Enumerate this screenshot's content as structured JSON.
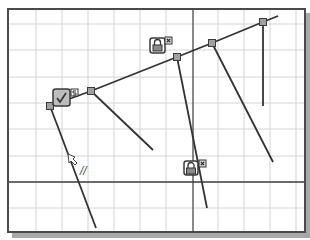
{
  "canvas": {
    "background": "#ffffff",
    "frame": {
      "x": 8,
      "y": 9,
      "w": 297,
      "h": 223,
      "color": "#4a4a4a",
      "shadow_color": "#a8a8a8"
    },
    "grid": {
      "color": "#d4d4d4",
      "vertical_x": [
        36,
        62,
        88,
        114,
        140,
        166,
        218,
        244,
        270,
        296
      ],
      "horizontal_y": [
        24,
        50,
        77,
        103,
        129,
        156,
        208
      ]
    },
    "axes": {
      "color": "#3a3a3a",
      "vertical_x": 193,
      "horizontal_y": 182
    }
  },
  "sketch": {
    "line_color": "#333333",
    "point_fill": "#a0a0a0",
    "point_stroke": "#3a3a3a",
    "main_polyline": [
      [
        50,
        106
      ],
      [
        91,
        91
      ],
      [
        177,
        57
      ],
      [
        212,
        43
      ],
      [
        263,
        22
      ],
      [
        278,
        16
      ]
    ],
    "points": [
      {
        "id": "p1",
        "x": 50,
        "y": 106
      },
      {
        "id": "p2",
        "x": 91,
        "y": 91
      },
      {
        "id": "p3",
        "x": 177,
        "y": 57
      },
      {
        "id": "p4",
        "x": 212,
        "y": 43
      },
      {
        "id": "p5",
        "x": 263,
        "y": 22
      }
    ],
    "branch_lines": [
      {
        "id": "from-p1",
        "x1": 50,
        "y1": 106,
        "x2": 96,
        "y2": 228
      },
      {
        "id": "from-p2",
        "x1": 91,
        "y1": 91,
        "x2": 153,
        "y2": 150
      },
      {
        "id": "from-p3",
        "x1": 177,
        "y1": 57,
        "x2": 207,
        "y2": 208
      },
      {
        "id": "from-p4",
        "x1": 212,
        "y1": 43,
        "x2": 273,
        "y2": 162
      },
      {
        "id": "from-p5",
        "x1": 263,
        "y1": 22,
        "x2": 263,
        "y2": 106
      }
    ]
  },
  "constraints": [
    {
      "id": "tangent",
      "icon": "checkmark-icon",
      "x": 53,
      "y": 89,
      "size": 17,
      "badge": "settings",
      "badge_x": 71,
      "badge_y": 89
    },
    {
      "id": "fix-top",
      "icon": "lock-icon",
      "x": 150,
      "y": 38,
      "size": 15,
      "badge": "x",
      "badge_x": 165,
      "badge_y": 37
    },
    {
      "id": "fix-bottom",
      "icon": "lock-icon",
      "x": 184,
      "y": 161,
      "size": 14,
      "badge": "x",
      "badge_x": 199,
      "badge_y": 160
    }
  ],
  "cursor": {
    "icon": "pointer-cursor-icon",
    "x": 68,
    "y": 154,
    "symbol": "//",
    "symbol_x": 80,
    "symbol_y": 174
  }
}
